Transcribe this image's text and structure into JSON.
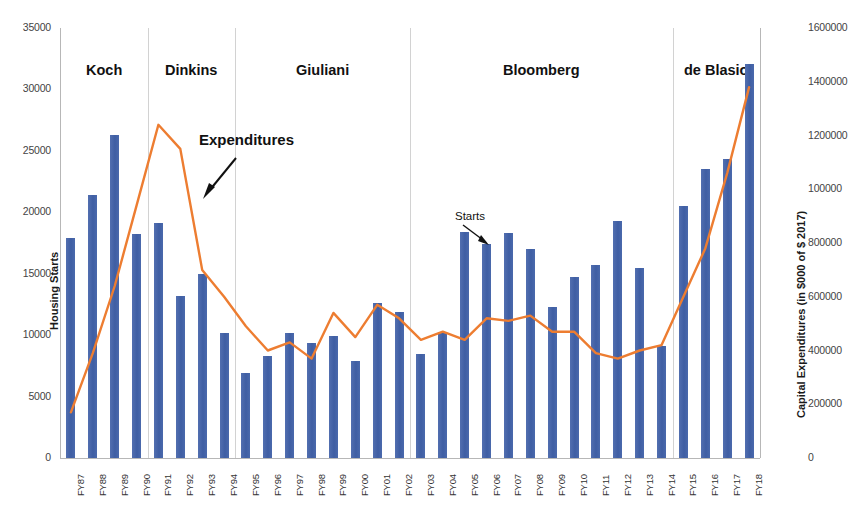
{
  "chart_data": {
    "type": "bar",
    "title": "",
    "subtitle": "",
    "xlabel": "",
    "ylabel": "Housing Starts",
    "y2label": "Capital Expenditures (in $000 of $ 2017)",
    "grid": false,
    "legend_position": "none",
    "categories": [
      "FY87",
      "FY88",
      "FY89",
      "FY90",
      "FY91",
      "FY92",
      "FY93",
      "FY94",
      "FY95",
      "FY96",
      "FY97",
      "FY98",
      "FY99",
      "FY00",
      "FY01",
      "FY02",
      "FY03",
      "FY04",
      "FY05",
      "FY06",
      "FY07",
      "FY08",
      "FY09",
      "FY10",
      "FY11",
      "FY12",
      "FY13",
      "FY14",
      "FY15",
      "FY16",
      "FY17",
      "FY18"
    ],
    "ylim": [
      0,
      35000
    ],
    "y_ticks": [
      "0",
      "5000",
      "10000",
      "15000",
      "20000",
      "25000",
      "30000",
      "35000"
    ],
    "y2lim": [
      0,
      1600000
    ],
    "y2_ticks": [
      "0",
      "200000",
      "400000",
      "600000",
      "800000",
      "100000",
      "1200000",
      "1400000",
      "1600000"
    ],
    "series": [
      {
        "name": "Starts",
        "type": "bar",
        "axis": "left",
        "color": "#4a68ab",
        "values": [
          17900,
          21400,
          26300,
          18200,
          19100,
          13200,
          15000,
          10200,
          6900,
          8300,
          10200,
          9400,
          9900,
          7900,
          12600,
          11900,
          8500,
          10200,
          18400,
          17400,
          18300,
          17000,
          12300,
          14700,
          15700,
          19300,
          15500,
          9100,
          20500,
          23500,
          24300,
          32100
        ]
      },
      {
        "name": "Expenditures",
        "type": "line",
        "axis": "right",
        "color": "#ed7d31",
        "values": [
          170000,
          390000,
          640000,
          940000,
          1240000,
          1150000,
          700000,
          600000,
          490000,
          400000,
          430000,
          370000,
          540000,
          450000,
          570000,
          520000,
          440000,
          470000,
          440000,
          520000,
          510000,
          530000,
          470000,
          470000,
          390000,
          370000,
          400000,
          420000,
          600000,
          780000,
          1060000,
          1380000
        ]
      }
    ],
    "eras": [
      {
        "label": "Koch",
        "start_index": 0,
        "end_index": 3
      },
      {
        "label": "Dinkins",
        "start_index": 4,
        "end_index": 7
      },
      {
        "label": "Giuliani",
        "start_index": 8,
        "end_index": 15
      },
      {
        "label": "Bloomberg",
        "start_index": 16,
        "end_index": 27
      },
      {
        "label": "de Blasio",
        "start_index": 28,
        "end_index": 31
      }
    ],
    "annotations": [
      {
        "name": "expenditures",
        "text": "Expenditures"
      },
      {
        "name": "starts",
        "text": "Starts"
      }
    ],
    "colors": {
      "bar": "#4a68ab",
      "line": "#ed7d31",
      "axis": "#b7b7b7",
      "divider": "#d2d2d2",
      "text": "#262626"
    }
  }
}
